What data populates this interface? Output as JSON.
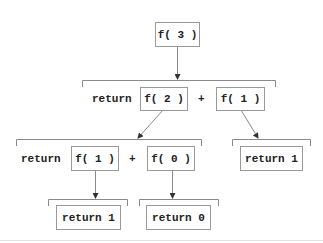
{
  "diagram": {
    "type": "recursion-call-tree",
    "root": {
      "label": "f( 3 )"
    },
    "level1": {
      "keyword": "return",
      "left_call": "f( 2 )",
      "operator": "+",
      "right_call": "f( 1 )"
    },
    "level2_left": {
      "keyword": "return",
      "left_call": "f( 1 )",
      "operator": "+",
      "right_call": "f( 0 )"
    },
    "level2_right": {
      "label": "return 1"
    },
    "level3_left": {
      "label": "return 1"
    },
    "level3_right": {
      "label": "return 0"
    },
    "colors": {
      "line": "#8a8a8a",
      "border": "#9a9a9a",
      "text": "#222222",
      "background": "#ffffff"
    }
  }
}
